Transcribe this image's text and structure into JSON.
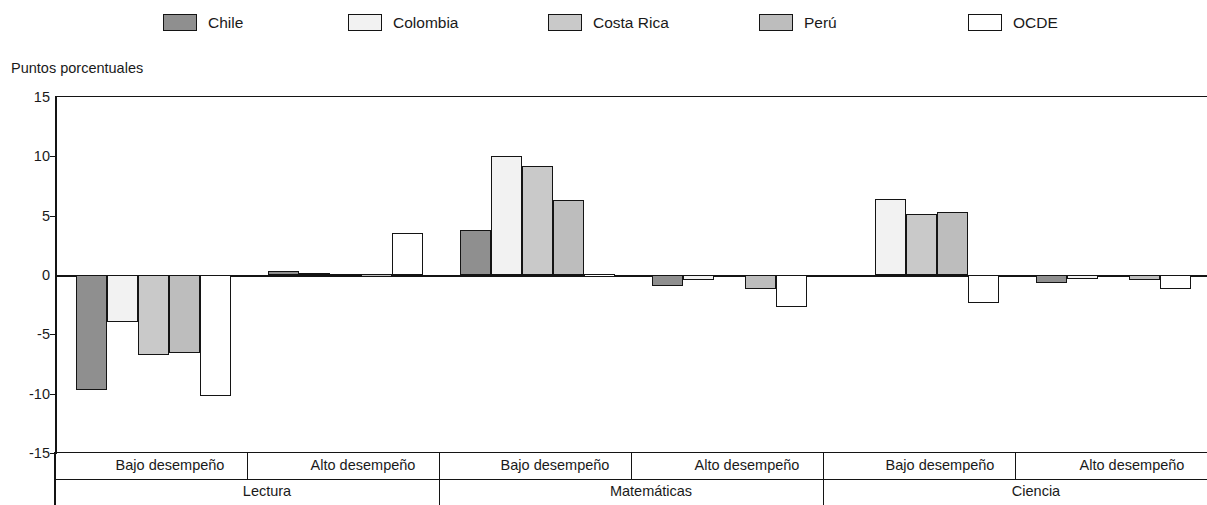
{
  "axis_title": "Puntos porcentuales",
  "legend": {
    "items": [
      {
        "label": "Chile",
        "color": "#8f8f8f",
        "x": 163
      },
      {
        "label": "Colombia",
        "color": "#f2f2f2",
        "x": 348
      },
      {
        "label": "Costa Rica",
        "color": "#c9c9c9",
        "x": 548
      },
      {
        "label": "Perú",
        "color": "#bdbdbd",
        "x": 759
      },
      {
        "label": "OCDE",
        "color": "#ffffff",
        "x": 968
      }
    ]
  },
  "chart_data": {
    "type": "bar",
    "title": "",
    "xlabel": "",
    "ylabel": "Puntos porcentuales",
    "ylim": [
      -15,
      15
    ],
    "yticks": [
      15,
      10,
      5,
      0,
      -5,
      -10,
      -15
    ],
    "ytick_labels": [
      "15",
      "10",
      "5",
      "0",
      "-5",
      "-10",
      "-15"
    ],
    "grid": false,
    "legend_position": "top",
    "subject_groups": [
      "Lectura",
      "Matemáticas",
      "Ciencia"
    ],
    "performance_groups": [
      "Bajo desempeño",
      "Alto desempeño"
    ],
    "categories": [
      "Lectura - Bajo desempeño",
      "Lectura - Alto desempeño",
      "Matemáticas - Bajo desempeño",
      "Matemáticas - Alto desempeño",
      "Ciencia - Bajo desempeño",
      "Ciencia - Alto desempeño"
    ],
    "series": [
      {
        "name": "Chile",
        "values": [
          -9.7,
          0.3,
          3.8,
          -0.9,
          -0.2,
          -0.7
        ]
      },
      {
        "name": "Colombia",
        "values": [
          -4.0,
          0.15,
          10.0,
          -0.4,
          6.4,
          -0.3
        ]
      },
      {
        "name": "Costa Rica",
        "values": [
          -6.7,
          0.1,
          9.2,
          -0.2,
          5.1,
          -0.1
        ]
      },
      {
        "name": "Perú",
        "values": [
          -6.6,
          0.05,
          6.3,
          -1.2,
          5.3,
          -0.4
        ]
      },
      {
        "name": "OCDE",
        "values": [
          -10.2,
          3.5,
          0.05,
          -2.7,
          -2.4,
          -1.2
        ]
      }
    ]
  },
  "cat_axis": {
    "perf_labels": [
      {
        "text": "Bajo desempeño",
        "center": 115
      },
      {
        "text": "Alto desempeño",
        "center": 308
      },
      {
        "text": "Bajo desempeño",
        "center": 500
      },
      {
        "text": "Alto desempeño",
        "center": 692
      },
      {
        "text": "Bajo desempeño",
        "center": 885
      },
      {
        "text": "Alto desempeño",
        "center": 1077
      }
    ],
    "subject_labels": [
      {
        "text": "Lectura",
        "center": 212
      },
      {
        "text": "Matemáticas",
        "center": 596
      },
      {
        "text": "Ciencia",
        "center": 981
      }
    ]
  }
}
